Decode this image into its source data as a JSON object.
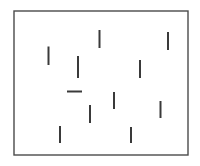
{
  "figure": {
    "kind": "line-orientation-array",
    "background_color": "#ffffff",
    "canvas": {
      "width": 200,
      "height": 166
    }
  },
  "frame": {
    "name": "bounding-rectangle",
    "x": 14,
    "y": 11,
    "width": 174,
    "height": 144,
    "stroke_color": "#4a4a4a",
    "stroke_width": 1.4,
    "fill": "none"
  },
  "segments": {
    "stroke_color": "#3a3a3a",
    "stroke_width": 2,
    "count": 12,
    "items": [
      {
        "id": 1,
        "label": "segment-top-center",
        "orientation": "vertical",
        "x1": 99.5,
        "y1": 30,
        "x2": 99.5,
        "y2": 48
      },
      {
        "id": 2,
        "label": "segment-top-right",
        "orientation": "vertical",
        "x1": 168,
        "y1": 32,
        "x2": 168,
        "y2": 50
      },
      {
        "id": 3,
        "label": "segment-upper-left",
        "orientation": "vertical",
        "x1": 48.5,
        "y1": 46.5,
        "x2": 48.5,
        "y2": 65
      },
      {
        "id": 4,
        "label": "segment-upper-mid-left",
        "orientation": "vertical",
        "x1": 78,
        "y1": 56,
        "x2": 78,
        "y2": 78
      },
      {
        "id": 5,
        "label": "segment-upper-mid-right",
        "orientation": "vertical",
        "x1": 140,
        "y1": 60,
        "x2": 140,
        "y2": 78
      },
      {
        "id": 6,
        "label": "segment-center-horizontal",
        "orientation": "horizontal",
        "x1": 67,
        "y1": 91.5,
        "x2": 82,
        "y2": 91.5
      },
      {
        "id": 7,
        "label": "segment-center",
        "orientation": "vertical",
        "x1": 114,
        "y1": 92,
        "x2": 114,
        "y2": 109
      },
      {
        "id": 8,
        "label": "segment-lower-right",
        "orientation": "vertical",
        "x1": 160.5,
        "y1": 101,
        "x2": 160.5,
        "y2": 118
      },
      {
        "id": 9,
        "label": "segment-lower-center-left",
        "orientation": "vertical",
        "x1": 90,
        "y1": 105,
        "x2": 90,
        "y2": 123
      },
      {
        "id": 10,
        "label": "segment-bottom-left",
        "orientation": "vertical",
        "x1": 60,
        "y1": 126,
        "x2": 60,
        "y2": 143
      },
      {
        "id": 11,
        "label": "segment-bottom-center",
        "orientation": "vertical",
        "x1": 131,
        "y1": 127,
        "x2": 131,
        "y2": 143
      }
    ]
  }
}
